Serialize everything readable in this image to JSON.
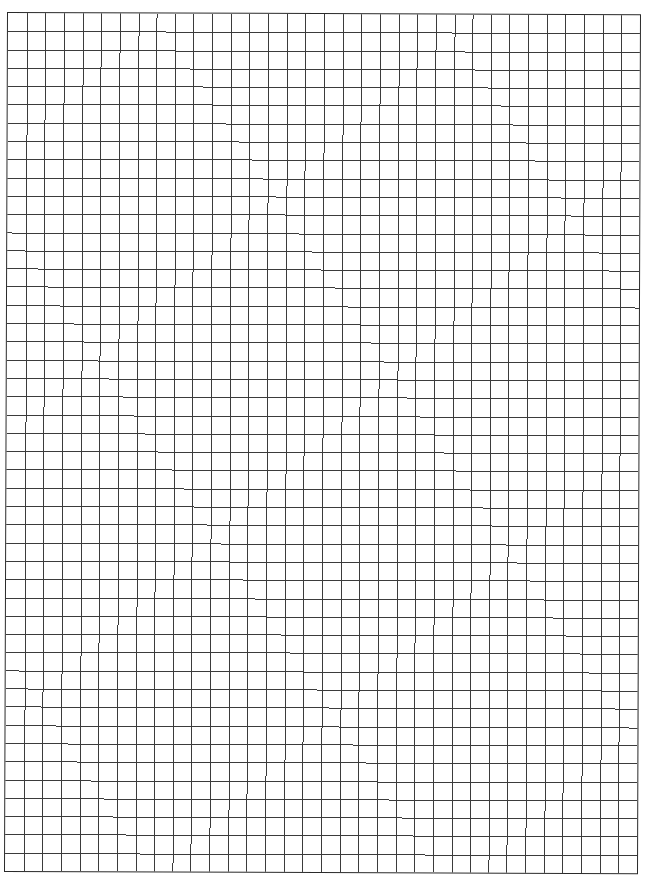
{
  "page": {
    "type": "graph-paper",
    "background_color": "#ffffff",
    "line_color": "#3a3a3a",
    "border_color": "#2a2a2a"
  },
  "grid": {
    "columns": 34,
    "rows": 47,
    "left": 7,
    "top": 12,
    "width": 634,
    "height": 860
  }
}
